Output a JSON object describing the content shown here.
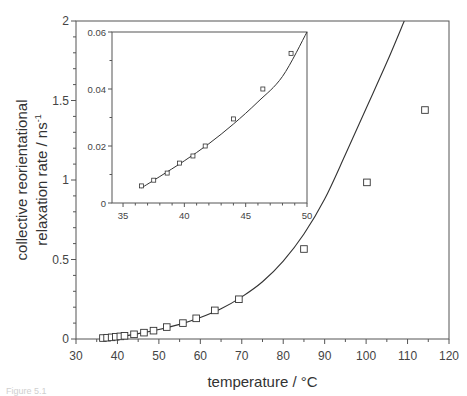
{
  "chart_data": [
    {
      "type": "scatter",
      "title": "",
      "xlabel": "temperature / °C",
      "ylabel_line1": "collective reorientational",
      "ylabel_line2": "relaxation rate / ns",
      "ylabel_superscript": "-1",
      "xlim": [
        30,
        120
      ],
      "ylim": [
        0,
        2
      ],
      "x_ticks": [
        30,
        40,
        50,
        60,
        70,
        80,
        90,
        100,
        110,
        120
      ],
      "y_ticks": [
        0,
        0.5,
        1,
        1.5,
        2
      ],
      "y_tick_labels": [
        "0",
        "0.5",
        "1",
        "1.5",
        "2"
      ],
      "grid": false,
      "legend": null,
      "series": [
        {
          "name": "measured",
          "marker": "open-square",
          "x": [
            36.5,
            37.5,
            38.6,
            39.6,
            40.7,
            41.7,
            44.0,
            46.4,
            48.7,
            51.9,
            55.8,
            59.0,
            63.5,
            69.3,
            85.0,
            100.2,
            114.2
          ],
          "y": [
            0.006,
            0.008,
            0.0105,
            0.014,
            0.0165,
            0.02,
            0.0295,
            0.04,
            0.0525,
            0.075,
            0.1,
            0.13,
            0.18,
            0.25,
            0.566,
            0.985,
            1.44
          ]
        },
        {
          "name": "fit",
          "line": "solid",
          "x": [
            36.5,
            40,
            45,
            50,
            55,
            60,
            65,
            70,
            75,
            80,
            85,
            90,
            95,
            100,
            105,
            109.2
          ],
          "y": [
            0.0056,
            0.0135,
            0.034,
            0.06,
            0.092,
            0.135,
            0.19,
            0.265,
            0.36,
            0.49,
            0.66,
            0.88,
            1.16,
            1.45,
            1.74,
            2.0
          ]
        }
      ]
    },
    {
      "type": "scatter",
      "title": "inset",
      "xlabel": "",
      "ylabel": "",
      "xlim": [
        34.1,
        50
      ],
      "ylim": [
        0,
        0.06
      ],
      "x_ticks": [
        35,
        40,
        45,
        50
      ],
      "y_ticks": [
        0,
        0.02,
        0.04,
        0.06
      ],
      "y_tick_labels": [
        "0",
        "0.02",
        "0.04",
        "0.06"
      ],
      "grid": false,
      "series": [
        {
          "name": "measured",
          "marker": "open-square",
          "x": [
            36.5,
            37.5,
            38.6,
            39.6,
            40.7,
            41.7,
            44.0,
            46.4,
            48.7
          ],
          "y": [
            0.006,
            0.008,
            0.0105,
            0.014,
            0.0165,
            0.02,
            0.0295,
            0.04,
            0.0525
          ]
        },
        {
          "name": "fit",
          "line": "solid",
          "x": [
            36.5,
            38,
            40,
            42,
            44,
            46,
            48,
            50
          ],
          "y": [
            0.0053,
            0.0093,
            0.0148,
            0.0208,
            0.0277,
            0.0355,
            0.0444,
            0.06
          ]
        }
      ]
    }
  ],
  "caption": "Figure 5.1"
}
